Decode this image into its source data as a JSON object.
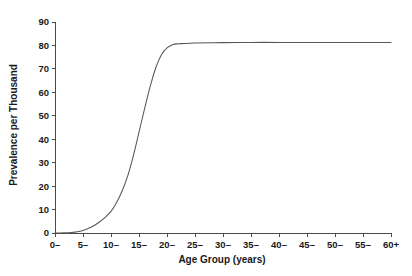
{
  "chart_data": {
    "type": "line",
    "title": "",
    "xlabel": "Age Group (years)",
    "ylabel": "Prevalence per Thousand",
    "grid": false,
    "legend": null,
    "xlim": [
      0,
      60
    ],
    "ylim": [
      0,
      90
    ],
    "x_tick_labels": [
      "0–",
      "5–",
      "10–",
      "15–",
      "20–",
      "25–",
      "30–",
      "35–",
      "40–",
      "45–",
      "50–",
      "55–",
      "60+"
    ],
    "x_tick_values": [
      0,
      5,
      10,
      15,
      20,
      25,
      30,
      35,
      40,
      45,
      50,
      55,
      60
    ],
    "y_tick_labels": [
      "0",
      "10",
      "20",
      "30",
      "40",
      "50",
      "60",
      "70",
      "80",
      "90"
    ],
    "y_tick_values": [
      0,
      10,
      20,
      30,
      40,
      50,
      60,
      70,
      80,
      90
    ],
    "series": [
      {
        "name": "Prevalence",
        "color": "#565656",
        "x": [
          0,
          1,
          2,
          3,
          4,
          5,
          6,
          7,
          8,
          9,
          10,
          11,
          12,
          13,
          14,
          15,
          16,
          17,
          18,
          19,
          20,
          21,
          22,
          23,
          24,
          25,
          30,
          35,
          40,
          45,
          50,
          55,
          60
        ],
        "values": [
          0.0,
          0.0,
          0.1,
          0.2,
          0.5,
          1.1,
          2.0,
          3.2,
          4.8,
          6.8,
          9.2,
          13.0,
          18.0,
          24.5,
          33.0,
          43.0,
          53.0,
          62.5,
          70.5,
          76.0,
          79.0,
          80.3,
          80.7,
          80.8,
          80.9,
          81.0,
          81.2,
          81.3,
          81.3,
          81.3,
          81.3,
          81.3,
          81.3
        ]
      }
    ]
  },
  "colors": {
    "axis": "#4a4a4a",
    "curve": "#565656",
    "text": "#1a1a1a",
    "background": "#ffffff"
  }
}
